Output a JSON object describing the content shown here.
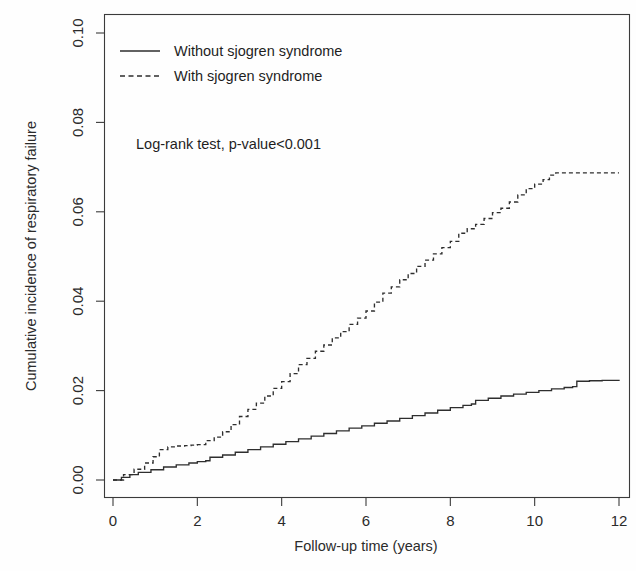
{
  "chart_data": {
    "type": "line",
    "title": "",
    "xlabel": "Follow-up time (years)",
    "ylabel": "Cumulative incidence of respiratory failure",
    "xlim": [
      0,
      12
    ],
    "ylim": [
      0,
      0.105
    ],
    "xticks": [
      0,
      2,
      4,
      6,
      8,
      10,
      12
    ],
    "xtick_labels": [
      "0",
      "2",
      "4",
      "6",
      "8",
      "10",
      "12"
    ],
    "yticks": [
      0.0,
      0.02,
      0.04,
      0.06,
      0.08,
      0.1
    ],
    "ytick_labels": [
      "0.00",
      "0.02",
      "0.04",
      "0.06",
      "0.08",
      "0.10"
    ],
    "grid": false,
    "legend_position": "top-left",
    "annotations": [
      {
        "text": "Log-rank test, p-value<0.001",
        "x": 0.75,
        "y": 0.0785
      }
    ],
    "series": [
      {
        "name": "Without sjogren syndrome",
        "style": "solid",
        "color": "#2e2e2e",
        "x": [
          0.0,
          0.2,
          0.4,
          0.6,
          0.9,
          1.2,
          1.5,
          1.8,
          2.0,
          2.2,
          2.3,
          2.6,
          2.9,
          3.2,
          3.5,
          3.8,
          4.1,
          4.4,
          4.7,
          5.0,
          5.3,
          5.6,
          5.9,
          6.2,
          6.5,
          6.8,
          7.1,
          7.4,
          7.7,
          8.0,
          8.3,
          8.5,
          8.6,
          8.9,
          9.2,
          9.5,
          9.8,
          10.1,
          10.4,
          10.7,
          10.9,
          11.0,
          11.3,
          11.6,
          12.0
        ],
        "y": [
          0.0,
          0.0006,
          0.0012,
          0.0017,
          0.0023,
          0.0029,
          0.0034,
          0.0038,
          0.0041,
          0.0043,
          0.0051,
          0.0056,
          0.0062,
          0.0068,
          0.0074,
          0.008,
          0.0086,
          0.0092,
          0.0098,
          0.0104,
          0.011,
          0.0116,
          0.0121,
          0.0127,
          0.0132,
          0.0138,
          0.0144,
          0.015,
          0.0156,
          0.0162,
          0.0167,
          0.017,
          0.0178,
          0.0183,
          0.0188,
          0.0192,
          0.0196,
          0.02,
          0.0204,
          0.0207,
          0.0209,
          0.0221,
          0.0222,
          0.0223,
          0.0224
        ]
      },
      {
        "name": "With sjogren syndrome",
        "style": "dashed",
        "color": "#2e2e2e",
        "x": [
          0.0,
          0.25,
          0.5,
          0.75,
          0.95,
          1.1,
          1.3,
          1.5,
          1.7,
          1.85,
          2.0,
          2.2,
          2.4,
          2.6,
          2.8,
          3.0,
          3.2,
          3.4,
          3.6,
          3.8,
          4.0,
          4.2,
          4.4,
          4.6,
          4.8,
          5.0,
          5.2,
          5.4,
          5.6,
          5.8,
          6.0,
          6.2,
          6.4,
          6.6,
          6.8,
          7.0,
          7.2,
          7.4,
          7.6,
          7.8,
          8.0,
          8.2,
          8.4,
          8.6,
          8.8,
          9.0,
          9.2,
          9.4,
          9.6,
          9.8,
          10.0,
          10.2,
          10.35,
          10.5,
          11.0,
          11.5,
          12.0
        ],
        "y": [
          0.0,
          0.0012,
          0.0024,
          0.0038,
          0.0052,
          0.0068,
          0.0074,
          0.0076,
          0.0077,
          0.0078,
          0.0079,
          0.0088,
          0.0096,
          0.0108,
          0.0124,
          0.0142,
          0.0158,
          0.0172,
          0.0188,
          0.0205,
          0.022,
          0.0238,
          0.0258,
          0.0272,
          0.0288,
          0.0302,
          0.0318,
          0.0332,
          0.0348,
          0.0362,
          0.0378,
          0.0398,
          0.0418,
          0.0432,
          0.0448,
          0.0462,
          0.0478,
          0.0492,
          0.0506,
          0.052,
          0.0534,
          0.0552,
          0.0562,
          0.0572,
          0.0585,
          0.0598,
          0.0608,
          0.0622,
          0.0638,
          0.0652,
          0.0662,
          0.0672,
          0.0682,
          0.0687,
          0.0687,
          0.0687,
          0.0687
        ]
      }
    ]
  },
  "legend": {
    "items": [
      {
        "label": "Without sjogren syndrome",
        "style": "solid"
      },
      {
        "label": "With sjogren syndrome",
        "style": "dashed"
      }
    ]
  },
  "axes": {
    "x_title": "Follow-up time (years)",
    "y_title": "Cumulative incidence of respiratory failure"
  },
  "annotation": {
    "text": "Log-rank test, p-value<0.001"
  },
  "colors": {
    "line": "#2e2e2e",
    "axis": "#3b3b3b",
    "background": "#fefefe"
  }
}
